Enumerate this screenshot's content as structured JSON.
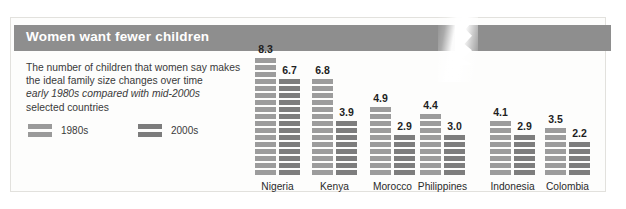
{
  "title": "Women want fewer children",
  "description": {
    "line1": "The number of children that women say makes",
    "line2": "the ideal family size changes over time",
    "line3": "early 1980s compared with mid-2000s",
    "line4": "selected countries"
  },
  "legend": [
    {
      "label": "1980s",
      "color": "#9c9c9c"
    },
    {
      "label": "2000s",
      "color": "#7d7d7d"
    }
  ],
  "colors": {
    "band": "#8e8e8e",
    "bar_1980s": "#9c9c9c",
    "bar_2000s": "#7d7d7d",
    "panel_background": "#fdfdfc",
    "panel_border": "#e2e1dd",
    "title_text": "#ffffff"
  },
  "chart_data": {
    "type": "bar",
    "title": "Women want fewer children",
    "subtitle": "The number of children that women say makes the ideal family size changes over time",
    "annotation": "early 1980s compared with mid-2000s, selected countries",
    "xlabel": "",
    "ylabel": "Ideal number of children",
    "ylim": [
      0,
      8.3
    ],
    "grid": false,
    "legend_position": "top-left",
    "categories": [
      "Nigeria",
      "Kenya",
      "Morocco",
      "Philippines",
      "Indonesia",
      "Colombia"
    ],
    "series": [
      {
        "name": "1980s",
        "values": [
          8.3,
          6.8,
          4.9,
          4.4,
          4.1,
          3.5
        ]
      },
      {
        "name": "2000s",
        "values": [
          6.7,
          3.9,
          2.9,
          3.0,
          2.9,
          2.2
        ]
      }
    ]
  }
}
